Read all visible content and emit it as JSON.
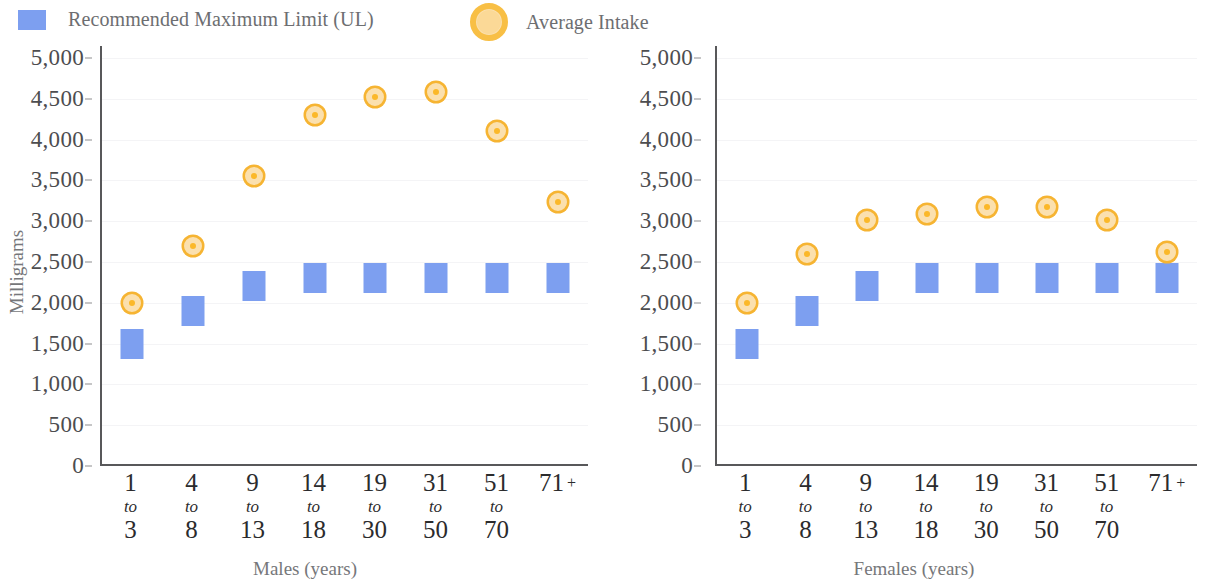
{
  "legend": {
    "items": [
      {
        "label": "Recommended Maximum Limit (UL)",
        "icon": "blue-square-swatch",
        "color": "#7d9ff0"
      },
      {
        "label": "Average Intake",
        "icon": "orange-circle-swatch",
        "color": "#fbb829"
      }
    ]
  },
  "chart_data": [
    {
      "type": "scatter",
      "title": "",
      "xlabel": "Males (years)",
      "ylabel": "Milligrams",
      "categories": [
        "1 to 3",
        "4 to 8",
        "9 to 13",
        "14 to 18",
        "19 to 30",
        "31 to 50",
        "51 to 70",
        "71 +"
      ],
      "category_lines": [
        [
          "1",
          "to",
          "3"
        ],
        [
          "4",
          "to",
          "8"
        ],
        [
          "9",
          "to",
          "13"
        ],
        [
          "14",
          "to",
          "18"
        ],
        [
          "19",
          "to",
          "30"
        ],
        [
          "31",
          "to",
          "50"
        ],
        [
          "51",
          "to",
          "70"
        ],
        [
          "71 +",
          "",
          ""
        ]
      ],
      "series": [
        {
          "name": "Recommended Maximum Limit (UL)",
          "marker": "square",
          "color": "#7d9ff0",
          "values": [
            1500,
            1900,
            2200,
            2300,
            2300,
            2300,
            2300,
            2300
          ]
        },
        {
          "name": "Average Intake",
          "marker": "circle",
          "color": "#fbb829",
          "values": [
            2000,
            2700,
            3550,
            4300,
            4520,
            4580,
            4100,
            3230
          ]
        }
      ],
      "ylim": [
        0,
        5000
      ],
      "yticks": [
        0,
        500,
        1000,
        1500,
        2000,
        2500,
        3000,
        3500,
        4000,
        4500,
        5000
      ],
      "ytick_labels": [
        "0",
        "500",
        "1,000",
        "1,500",
        "2,000",
        "2,500",
        "3,000",
        "3,500",
        "4,000",
        "4,500",
        "5,000"
      ],
      "grid": true,
      "legend_position": "top-left"
    },
    {
      "type": "scatter",
      "title": "",
      "xlabel": "Females (years)",
      "ylabel": "",
      "categories": [
        "1 to 3",
        "4 to 8",
        "9 to 13",
        "14 to 18",
        "19 to 30",
        "31 to 50",
        "51 to 70",
        "71 +"
      ],
      "category_lines": [
        [
          "1",
          "to",
          "3"
        ],
        [
          "4",
          "to",
          "8"
        ],
        [
          "9",
          "to",
          "13"
        ],
        [
          "14",
          "to",
          "18"
        ],
        [
          "19",
          "to",
          "30"
        ],
        [
          "31",
          "to",
          "50"
        ],
        [
          "51",
          "to",
          "70"
        ],
        [
          "71 +",
          "",
          ""
        ]
      ],
      "series": [
        {
          "name": "Recommended Maximum Limit (UL)",
          "marker": "square",
          "color": "#7d9ff0",
          "values": [
            1500,
            1900,
            2200,
            2300,
            2300,
            2300,
            2300,
            2300
          ]
        },
        {
          "name": "Average Intake",
          "marker": "circle",
          "color": "#fbb829",
          "values": [
            2000,
            2600,
            3010,
            3090,
            3170,
            3170,
            3020,
            2620
          ]
        }
      ],
      "ylim": [
        0,
        5000
      ],
      "yticks": [
        0,
        500,
        1000,
        1500,
        2000,
        2500,
        3000,
        3500,
        4000,
        4500,
        5000
      ],
      "ytick_labels": [
        "0",
        "500",
        "1,000",
        "1,500",
        "2,000",
        "2,500",
        "3,000",
        "3,500",
        "4,000",
        "4,500",
        "5,000"
      ],
      "grid": true,
      "legend_position": "top-left"
    }
  ]
}
